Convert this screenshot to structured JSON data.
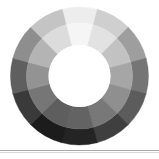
{
  "figure": {
    "background_color": "#ffffff",
    "width": 159,
    "height": 159
  },
  "divider": {
    "name": "horizontal-rule",
    "y": 150,
    "color": "#a8a8a8",
    "shadow_y": 152,
    "shadow_color": "#d8d8d8"
  },
  "chart_data": {
    "type": "pie",
    "variant": "donut-sunburst",
    "subtitle": "",
    "xlabel": "",
    "ylabel": "",
    "grid": false,
    "legend_position": "none",
    "center_x": 79.5,
    "center_y": 76.0,
    "outer_radius": 69.0,
    "middle_radius": 53.0,
    "inner_radius": 31.0,
    "sector_count": 12,
    "ring_count": 2,
    "sector_angle_degrees": 30,
    "start_angle_degrees": -105,
    "categories": [
      "sector-01",
      "sector-02",
      "sector-03",
      "sector-04",
      "sector-05",
      "sector-06",
      "sector-07",
      "sector-08",
      "sector-09",
      "sector-10",
      "sector-11",
      "sector-12"
    ],
    "values": [
      30,
      30,
      30,
      30,
      30,
      30,
      30,
      30,
      30,
      30,
      30,
      30
    ],
    "series": [
      {
        "name": "outer-ring",
        "ring_index": 0,
        "r_inner": 53.0,
        "r_outer": 69.0,
        "values": [
          30,
          30,
          30,
          30,
          30,
          30,
          30,
          30,
          30,
          30,
          30,
          30
        ],
        "colors": [
          "#ededed",
          "#cfcfcf",
          "#9e9e9e",
          "#757575",
          "#5c5c5c",
          "#3f3f3f",
          "#242424",
          "#1c1c1c",
          "#3a3a3a",
          "#5f5f5f",
          "#8e8e8e",
          "#c4c4c4"
        ]
      },
      {
        "name": "inner-ring",
        "ring_index": 1,
        "r_inner": 31.0,
        "r_outer": 53.0,
        "values": [
          30,
          30,
          30,
          30,
          30,
          30,
          30,
          30,
          30,
          30,
          30,
          30
        ],
        "colors": [
          "#f5f5f5",
          "#e2e2e2",
          "#c2c2c2",
          "#a6a6a6",
          "#8f8f8f",
          "#787878",
          "#636363",
          "#5e5e5e",
          "#767676",
          "#939393",
          "#b4b4b4",
          "#dcdcdc"
        ]
      }
    ],
    "annotations": []
  }
}
